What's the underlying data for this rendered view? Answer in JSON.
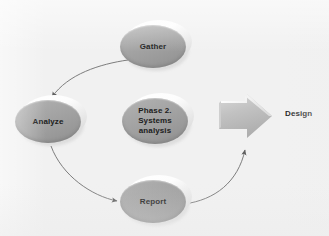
{
  "diagram": {
    "background_color": "#f1f1f1",
    "node_fill_color": "#a3a3a3",
    "text_color": "#1c1c1c",
    "connector_color": "#6f6f6f",
    "nodes": [
      {
        "id": "gather",
        "label": "Gather",
        "shape": "ellipse",
        "x": 120,
        "y": 25,
        "w": 66,
        "h": 43
      },
      {
        "id": "analyze",
        "label": "Analyze",
        "shape": "ellipse",
        "x": 15,
        "y": 100,
        "w": 66,
        "h": 43
      },
      {
        "id": "center",
        "label": "Phase 2.\nSystems\nanalysis",
        "shape": "ellipse",
        "x": 122,
        "y": 98,
        "w": 66,
        "h": 46
      },
      {
        "id": "report",
        "label": "Report",
        "shape": "ellipse",
        "x": 120,
        "y": 180,
        "w": 66,
        "h": 43
      }
    ],
    "connectors": [
      {
        "id": "gather-to-analyze",
        "from": "gather",
        "to": "analyze",
        "style": "curved-arrow"
      },
      {
        "id": "analyze-to-report",
        "from": "analyze",
        "to": "report",
        "style": "curved-arrow"
      },
      {
        "id": "report-to-design",
        "from": "report",
        "to": "design",
        "style": "curved-arrow"
      }
    ],
    "block_arrow": {
      "id": "design-block-arrow",
      "direction": "right",
      "fill_color": "#b9b9b9"
    },
    "design_label": "Design"
  }
}
